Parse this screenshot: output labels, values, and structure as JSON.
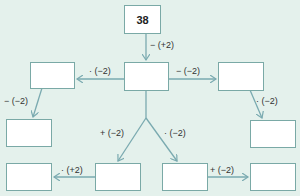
{
  "colors": {
    "background": "#e4f1ec",
    "box_border": "#7aa9a6",
    "arrow": "#7aaab0",
    "text": "#222222"
  },
  "boxes": {
    "start": {
      "value": "38"
    },
    "center": {
      "value": ""
    },
    "left_mid": {
      "value": ""
    },
    "right_mid": {
      "value": ""
    },
    "left_lower": {
      "value": ""
    },
    "right_lower": {
      "value": ""
    },
    "bottom_far_left": {
      "value": ""
    },
    "bottom_left_center": {
      "value": ""
    },
    "bottom_right_center": {
      "value": ""
    },
    "bottom_far_right": {
      "value": ""
    }
  },
  "operations": {
    "start_to_center": "− (+2)",
    "center_to_left_mid": "· (−2)",
    "center_to_right_mid": "− (−2)",
    "left_mid_to_left_lower": "− (−2)",
    "right_mid_to_right_lower": "· (−2)",
    "center_to_bottom_left_center": "+ (−2)",
    "center_to_bottom_right_center": "· (−2)",
    "bottom_left_center_to_far_left": "· (+2)",
    "bottom_right_center_to_far_right": "+ (−2)"
  }
}
